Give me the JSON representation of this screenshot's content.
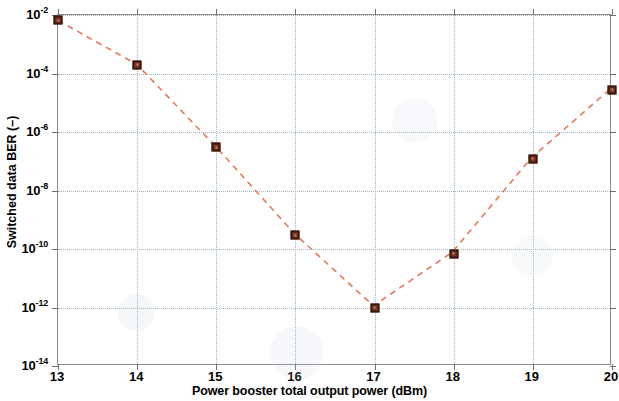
{
  "figure": {
    "background_color": "#ffffff",
    "axis_color": "#8a8a8a",
    "grid_color": "#9fb4c4",
    "line_color": "#e2795c",
    "marker_face_color": "#7a3b25",
    "marker_edge_color": "#3a1a10"
  },
  "chart_data": {
    "type": "line",
    "title": "",
    "xlabel": "Power booster total output power (dBm)",
    "ylabel": "Switched data BER (–)",
    "yscale": "log",
    "xscale": "linear",
    "xlim": [
      13,
      20
    ],
    "ylim": [
      1e-14,
      0.01
    ],
    "grid": true,
    "legend": null,
    "linestyle": "dashed",
    "marker": "square",
    "x": [
      13,
      14,
      15,
      16,
      17,
      18,
      19,
      20
    ],
    "values": [
      0.0065,
      0.0002,
      3e-07,
      3e-10,
      1e-12,
      7e-11,
      1.2e-07,
      2.8e-05
    ],
    "xticks": [
      {
        "value": 13,
        "label": "13"
      },
      {
        "value": 14,
        "label": "14"
      },
      {
        "value": 15,
        "label": "15"
      },
      {
        "value": 16,
        "label": "16"
      },
      {
        "value": 17,
        "label": "17"
      },
      {
        "value": 18,
        "label": "18"
      },
      {
        "value": 19,
        "label": "19"
      },
      {
        "value": 20,
        "label": "20"
      }
    ],
    "yticks": [
      {
        "value": 0.01,
        "mantissa": "10",
        "exponent": "-2"
      },
      {
        "value": 0.0001,
        "mantissa": "10",
        "exponent": "-4"
      },
      {
        "value": 1e-06,
        "mantissa": "10",
        "exponent": "-6"
      },
      {
        "value": 1e-08,
        "mantissa": "10",
        "exponent": "-8"
      },
      {
        "value": 1e-10,
        "mantissa": "10",
        "exponent": "-10"
      },
      {
        "value": 1e-12,
        "mantissa": "10",
        "exponent": "-12"
      },
      {
        "value": 1e-14,
        "mantissa": "10",
        "exponent": "-14"
      }
    ]
  }
}
